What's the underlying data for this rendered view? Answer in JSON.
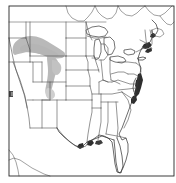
{
  "figure": {
    "kind": "thematic-distribution-map",
    "region_title": "United States",
    "width_px": 176,
    "height_px": 183,
    "background_color": "#ffffff",
    "frame": {
      "visible": true,
      "color": "#262626",
      "x": 9,
      "y": 6,
      "width": 165,
      "height": 170
    }
  },
  "colors": {
    "background": "#ffffff",
    "state_border": "#4d4d4d",
    "coastline": "#3a3a3a",
    "canada_border": "#555555",
    "frame": "#262626",
    "shade_light_gray": "#b9b9b9",
    "shade_mid_gray": "#a8a8a8",
    "shade_dark": "#2e2e2e",
    "lake_fill": "#ffffff"
  },
  "legend": {
    "visible": false,
    "entries": []
  },
  "annotations": {
    "title_text": "",
    "caption_text": "",
    "axis_labels": [],
    "visible_labels": []
  },
  "shaded_regions": [
    {
      "name": "northern-great-plains-band",
      "description": "light gray band across Montana, northern Wyoming and the western Dakotas",
      "color": "#b9b9b9",
      "states": [
        "Montana",
        "Wyoming",
        "North Dakota",
        "South Dakota"
      ]
    },
    {
      "name": "wyoming-colorado-spur",
      "description": "light gray spur extending south through eastern Wyoming into northern Colorado",
      "color": "#b9b9b9",
      "states": [
        "Wyoming",
        "Colorado"
      ]
    },
    {
      "name": "atlantic-coast-strip",
      "description": "dark shading along the Atlantic seaboard from Maine to the Carolinas",
      "color": "#2e2e2e",
      "states": [
        "Maine",
        "Massachusetts",
        "New Jersey",
        "Delaware",
        "Maryland",
        "Virginia",
        "North Carolina"
      ]
    },
    {
      "name": "gulf-coast-strip",
      "description": "dark shading along the Gulf coast of Louisiana and Texas",
      "color": "#2e2e2e",
      "states": [
        "Louisiana",
        "Texas",
        "Mississippi",
        "Alabama"
      ]
    }
  ],
  "features": {
    "great_lakes": [
      "Lake Superior",
      "Lake Michigan",
      "Lake Huron",
      "Lake Erie",
      "Lake Ontario"
    ],
    "peninsulas": [
      "Florida",
      "Cape Cod",
      "Delmarva"
    ],
    "state_borders_visible": true,
    "canada_outline_visible": true,
    "mexico_outline_visible": true
  }
}
